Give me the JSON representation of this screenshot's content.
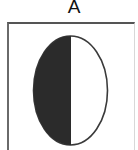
{
  "panel": {
    "label": "A"
  },
  "figure": {
    "shape": "ellipse",
    "ellipse": {
      "cx": 70.5,
      "cy": 90.5,
      "rx": 37,
      "ry": 54.5
    },
    "divider_x": 70.5,
    "colors": {
      "filled_half": "#2b2b2b",
      "empty_half": "#ffffff",
      "outline": "#3a3a3a",
      "frame": "#555555"
    }
  }
}
